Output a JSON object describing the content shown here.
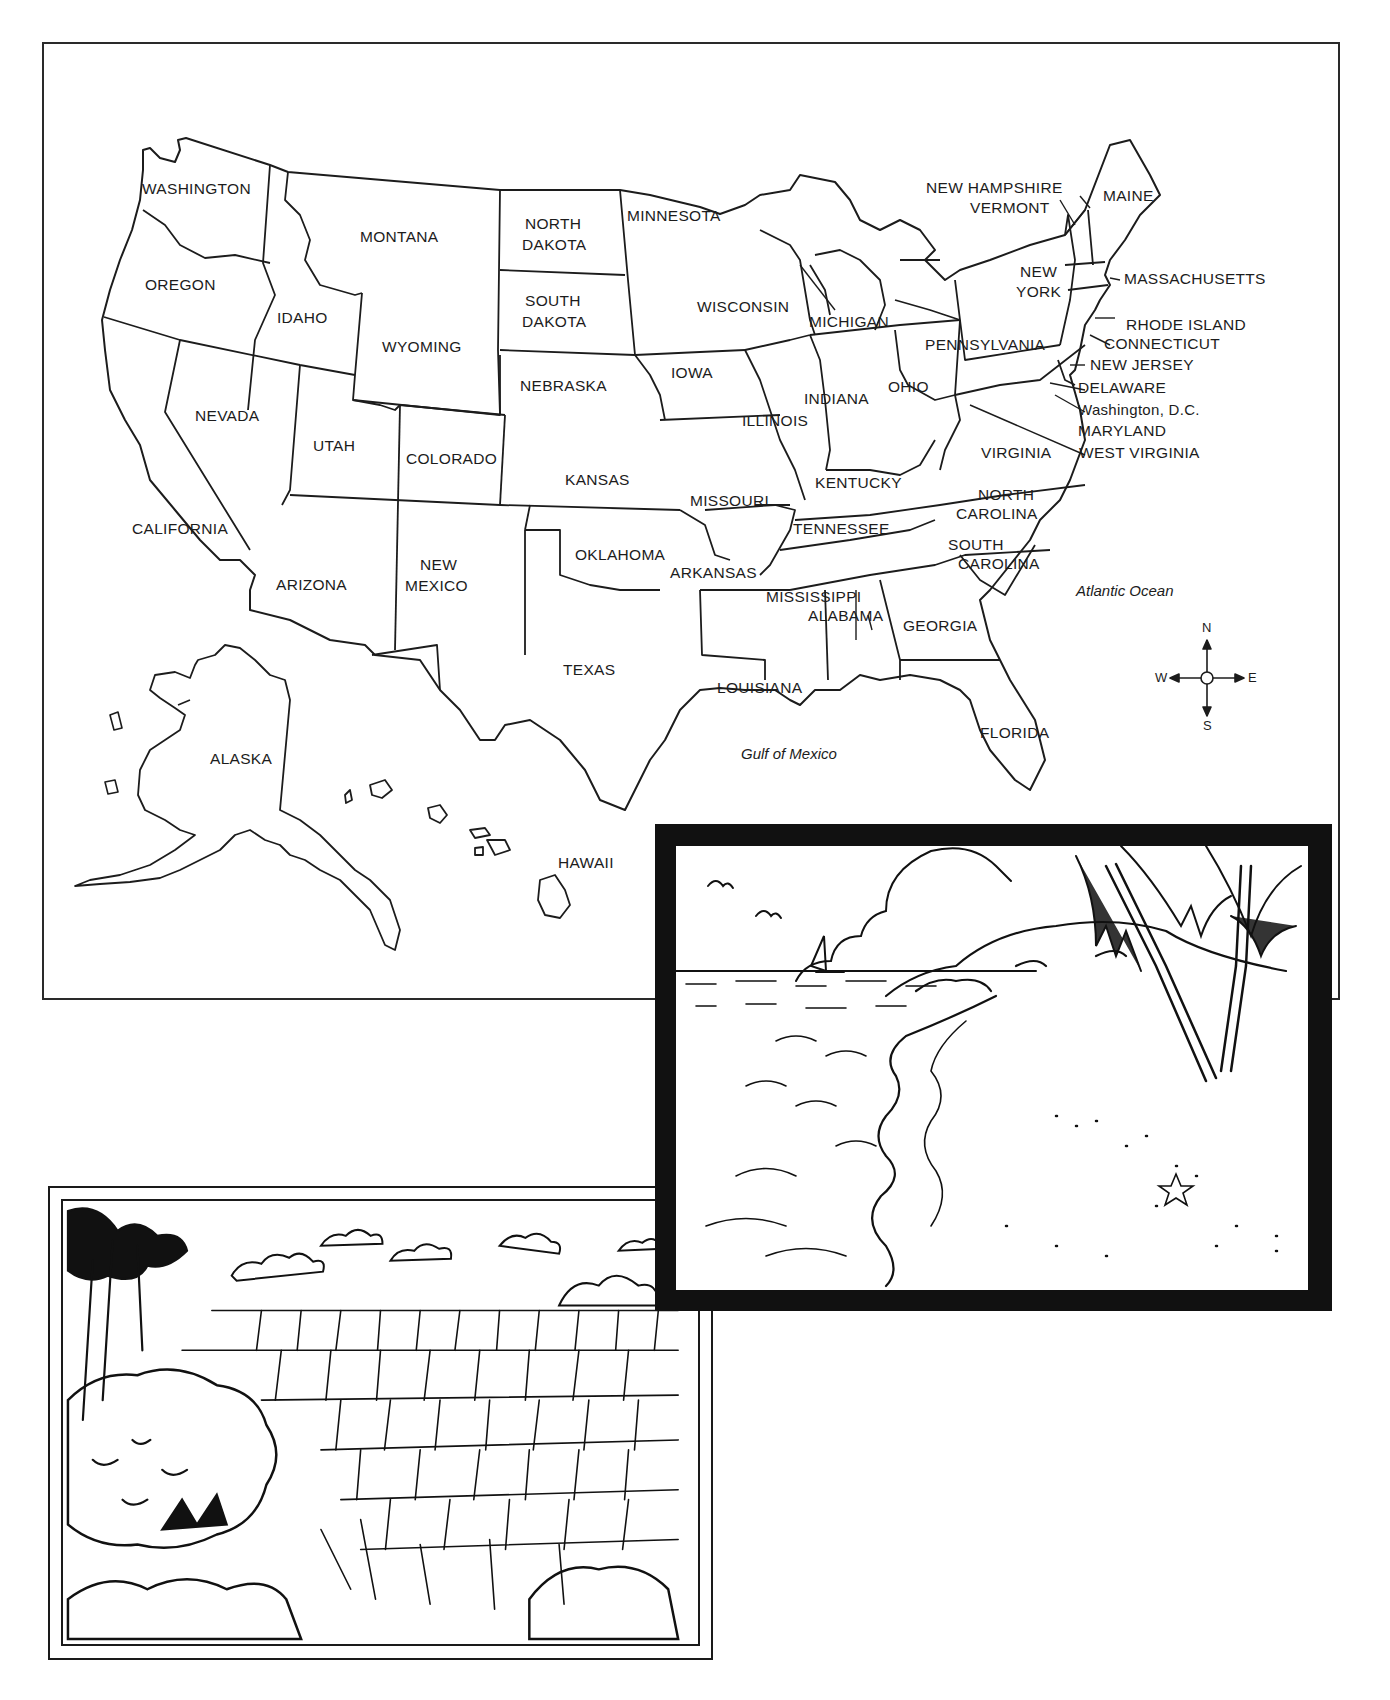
{
  "map": {
    "states": {
      "washington": "WASHINGTON",
      "oregon": "OREGON",
      "california": "CALIFORNIA",
      "nevada": "NEVADA",
      "idaho": "IDAHO",
      "montana": "MONTANA",
      "wyoming": "WYOMING",
      "utah": "UTAH",
      "arizona": "ARIZONA",
      "colorado": "COLORADO",
      "new_mexico_1": "NEW",
      "new_mexico_2": "MEXICO",
      "north_dakota_1": "NORTH",
      "north_dakota_2": "DAKOTA",
      "south_dakota_1": "SOUTH",
      "south_dakota_2": "DAKOTA",
      "nebraska": "NEBRASKA",
      "kansas": "KANSAS",
      "oklahoma": "OKLAHOMA",
      "texas": "TEXAS",
      "minnesota": "MINNESOTA",
      "iowa": "IOWA",
      "missouri": "MISSOURI",
      "arkansas": "ARKANSAS",
      "louisiana": "LOUISIANA",
      "wisconsin": "WISCONSIN",
      "illinois": "ILLINOIS",
      "michigan": "MICHIGAN",
      "indiana": "INDIANA",
      "ohio": "OHIO",
      "kentucky": "KENTUCKY",
      "tennessee": "TENNESSEE",
      "mississippi": "MISSISSIPPI",
      "alabama": "ALABAMA",
      "georgia": "GEORGIA",
      "florida": "FLORIDA",
      "south_carolina_1": "SOUTH",
      "south_carolina_2": "CAROLINA",
      "north_carolina_1": "NORTH",
      "north_carolina_2": "CAROLINA",
      "virginia": "VIRGINIA",
      "west_virginia": "WEST VIRGINIA",
      "pennsylvania": "PENNSYLVANIA",
      "new_york_1": "NEW",
      "new_york_2": "YORK",
      "new_hampshire": "NEW HAMPSHIRE",
      "vermont": "VERMONT",
      "maine": "MAINE",
      "massachusetts": "MASSACHUSETTS",
      "rhode_island": "RHODE ISLAND",
      "connecticut": "CONNECTICUT",
      "new_jersey": "NEW JERSEY",
      "delaware": "DELAWARE",
      "washington_dc": "Washington, D.C.",
      "maryland": "MARYLAND",
      "alaska": "ALASKA",
      "hawaii": "HAWAII"
    },
    "water_bodies": {
      "atlantic": "Atlantic Ocean",
      "gulf": "Gulf of Mexico"
    },
    "compass": {
      "north": "N",
      "south": "S",
      "east": "E",
      "west": "W"
    }
  },
  "illustrations": [
    {
      "name": "tropical-beach",
      "description": "Beach with palm trees, sailboat, clouds, birds and starfish"
    },
    {
      "name": "grand-canyon",
      "description": "Canyon landscape with mesas, clouds and trees"
    }
  ]
}
